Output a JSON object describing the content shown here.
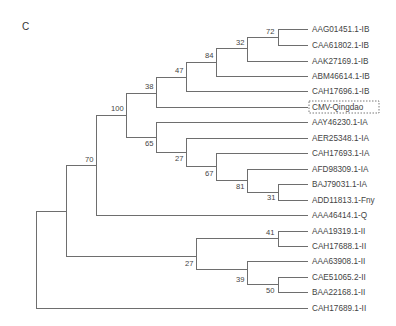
{
  "figure": {
    "panel_letter": "C",
    "highlight_leaf": "CMV-Qingdao"
  },
  "leaves": [
    {
      "id": "AAG01451.1-IB",
      "y": 29
    },
    {
      "id": "CAA61802.1-IB",
      "y": 45
    },
    {
      "id": "AAK27169.1-IB",
      "y": 61
    },
    {
      "id": "ABM46614.1-IB",
      "y": 76
    },
    {
      "id": "CAH17696.1-IB",
      "y": 91
    },
    {
      "id": "CMV-Qingdao",
      "y": 107
    },
    {
      "id": "AAY46230.1-IA",
      "y": 122
    },
    {
      "id": "AER25348.1-IA",
      "y": 138
    },
    {
      "id": "CAH17693.1-IA",
      "y": 153
    },
    {
      "id": "AFD98309.1-IA",
      "y": 169
    },
    {
      "id": "BAJ79031.1-IA",
      "y": 184
    },
    {
      "id": "ADD11813.1-Fny",
      "y": 200
    },
    {
      "id": "AAA46414.1-Q",
      "y": 215
    },
    {
      "id": "AAA19319.1-II",
      "y": 231
    },
    {
      "id": "CAH17688.1-II",
      "y": 246
    },
    {
      "id": "AAA63908.1-II",
      "y": 261
    },
    {
      "id": "CAE51065.2-II",
      "y": 277
    },
    {
      "id": "BAA22168.1-II",
      "y": 292
    },
    {
      "id": "CAH17689.1-II",
      "y": 308
    }
  ],
  "leaf_x": 308,
  "nodes": [
    {
      "id": "root",
      "x": 36,
      "y0": 211,
      "y1": 308,
      "parent_x": null,
      "y": 259,
      "support": ""
    },
    {
      "id": "nA",
      "x": 66,
      "y0": 165,
      "y1": 256,
      "parent_x": 36,
      "y": 211,
      "support": ""
    },
    {
      "id": "n70",
      "x": 96,
      "y0": 115,
      "y1": 215,
      "parent_x": 66,
      "y": 165,
      "support": "70",
      "lx": 85,
      "ly": 162
    },
    {
      "id": "n100",
      "x": 126,
      "y0": 93,
      "y1": 137,
      "parent_x": 96,
      "y": 115,
      "support": "100",
      "lx": 111,
      "ly": 111
    },
    {
      "id": "n38",
      "x": 156,
      "y0": 77,
      "y1": 107,
      "parent_x": 126,
      "y": 93,
      "support": "38",
      "lx": 145,
      "ly": 89
    },
    {
      "id": "n47",
      "x": 186,
      "y0": 62,
      "y1": 91,
      "parent_x": 156,
      "y": 77,
      "support": "47",
      "lx": 175,
      "ly": 73
    },
    {
      "id": "n84",
      "x": 216,
      "y0": 48,
      "y1": 76,
      "parent_x": 186,
      "y": 62,
      "support": "84",
      "lx": 205,
      "ly": 58
    },
    {
      "id": "n32",
      "x": 247,
      "y0": 37,
      "y1": 61,
      "parent_x": 216,
      "y": 48,
      "support": "32",
      "lx": 236,
      "ly": 45
    },
    {
      "id": "n72",
      "x": 278,
      "y0": 29,
      "y1": 45,
      "parent_x": 247,
      "y": 37,
      "support": "72",
      "lx": 266,
      "ly": 34
    },
    {
      "id": "n65",
      "x": 156,
      "y0": 122,
      "y1": 152,
      "parent_x": 126,
      "y": 137,
      "support": "65",
      "lx": 145,
      "ly": 146
    },
    {
      "id": "n27a",
      "x": 186,
      "y0": 138,
      "y1": 166,
      "parent_x": 156,
      "y": 152,
      "support": "27",
      "lx": 175,
      "ly": 161
    },
    {
      "id": "n67",
      "x": 216,
      "y0": 153,
      "y1": 180,
      "parent_x": 186,
      "y": 166,
      "support": "67",
      "lx": 205,
      "ly": 176
    },
    {
      "id": "n81",
      "x": 247,
      "y0": 169,
      "y1": 192,
      "parent_x": 216,
      "y": 180,
      "support": "81",
      "lx": 236,
      "ly": 189
    },
    {
      "id": "n31",
      "x": 278,
      "y0": 184,
      "y1": 200,
      "parent_x": 247,
      "y": 192,
      "support": "31",
      "lx": 267,
      "ly": 200
    },
    {
      "id": "n27b",
      "x": 196,
      "y0": 238,
      "y1": 269,
      "parent_x": 66,
      "y": 256,
      "support": "27",
      "lx": 185,
      "ly": 266
    },
    {
      "id": "n41",
      "x": 278,
      "y0": 231,
      "y1": 246,
      "parent_x": 196,
      "y": 238,
      "support": "41",
      "lx": 266,
      "ly": 235
    },
    {
      "id": "n39",
      "x": 247,
      "y0": 261,
      "y1": 284,
      "parent_x": 196,
      "y": 269,
      "support": "39",
      "lx": 236,
      "ly": 282
    },
    {
      "id": "n50",
      "x": 278,
      "y0": 277,
      "y1": 292,
      "parent_x": 247,
      "y": 284,
      "support": "50",
      "lx": 266,
      "ly": 293
    }
  ],
  "leaf_parents": {
    "AAG01451.1-IB": 278,
    "CAA61802.1-IB": 278,
    "AAK27169.1-IB": 247,
    "ABM46614.1-IB": 216,
    "CAH17696.1-IB": 186,
    "CMV-Qingdao": 156,
    "AAY46230.1-IA": 156,
    "AER25348.1-IA": 186,
    "CAH17693.1-IA": 216,
    "AFD98309.1-IA": 247,
    "BAJ79031.1-IA": 278,
    "ADD11813.1-Fny": 278,
    "AAA46414.1-Q": 96,
    "AAA19319.1-II": 278,
    "CAH17688.1-II": 278,
    "AAA63908.1-II": 247,
    "CAE51065.2-II": 278,
    "BAA22168.1-II": 278,
    "CAH17689.1-II": 36
  },
  "colors": {
    "branch": "#6e6e6e",
    "text": "#444444"
  }
}
